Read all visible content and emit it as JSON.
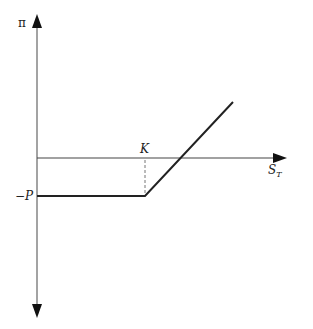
{
  "diagram": {
    "type": "option payoff (long call profit)",
    "y_axis_label": "π",
    "x_axis_label": "S",
    "x_axis_subscript": "T",
    "strike_label": "K",
    "premium_label": "−P",
    "colors": {
      "axis": "#555555",
      "payoff": "#222222",
      "dashed": "#777777"
    }
  }
}
